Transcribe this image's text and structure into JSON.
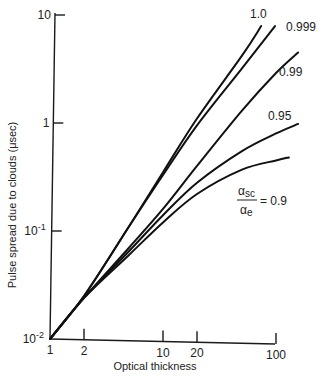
{
  "chart_data": {
    "type": "line",
    "title": "",
    "xlabel": "Optical thickness",
    "ylabel": "Pulse spread due to clouds (μsec)",
    "xscale": "log",
    "yscale": "log",
    "xlim": [
      1,
      100
    ],
    "ylim": [
      0.01,
      10
    ],
    "grid": false,
    "legend": "inline curve labels",
    "x_ticks": [
      {
        "value": 1,
        "label": "1"
      },
      {
        "value": 2,
        "label": "2"
      },
      {
        "value": 10,
        "label": "10"
      },
      {
        "value": 20,
        "label": "20"
      },
      {
        "value": 100,
        "label": "100"
      }
    ],
    "y_ticks": [
      {
        "value": 0.01,
        "base": "10",
        "exp": "-2"
      },
      {
        "value": 0.1,
        "base": "10",
        "exp": "-1"
      },
      {
        "value": 1,
        "base": "1",
        "exp": ""
      },
      {
        "value": 10,
        "base": "10",
        "exp": ""
      }
    ],
    "parameter_label": {
      "numerator": "α",
      "num_sub": "sc",
      "denominator": "α",
      "den_sub": "e",
      "equals": "= 0.9"
    },
    "series": [
      {
        "name": "1.0",
        "label": "1.0",
        "x": [
          1,
          2,
          5,
          10,
          20,
          50,
          74
        ],
        "y": [
          0.01,
          0.025,
          0.11,
          0.35,
          1.1,
          4.2,
          7.9
        ]
      },
      {
        "name": "0.999",
        "label": "0.999",
        "x": [
          1,
          2,
          5,
          10,
          20,
          50,
          98
        ],
        "y": [
          0.01,
          0.025,
          0.11,
          0.33,
          0.95,
          3.2,
          7.9
        ]
      },
      {
        "name": "0.99",
        "label": "0.99",
        "x": [
          1,
          2,
          5,
          10,
          20,
          50,
          100,
          157
        ],
        "y": [
          0.01,
          0.024,
          0.07,
          0.16,
          0.4,
          1.3,
          2.9,
          4.5
        ]
      },
      {
        "name": "0.95",
        "label": "0.95",
        "x": [
          1,
          2,
          5,
          10,
          20,
          50,
          100,
          157
        ],
        "y": [
          0.01,
          0.024,
          0.065,
          0.14,
          0.28,
          0.55,
          0.8,
          0.98
        ]
      },
      {
        "name": "0.9",
        "label": "0.9",
        "x": [
          1,
          2,
          5,
          10,
          20,
          50,
          100,
          130
        ],
        "y": [
          0.01,
          0.024,
          0.06,
          0.12,
          0.22,
          0.37,
          0.45,
          0.48
        ]
      }
    ]
  }
}
